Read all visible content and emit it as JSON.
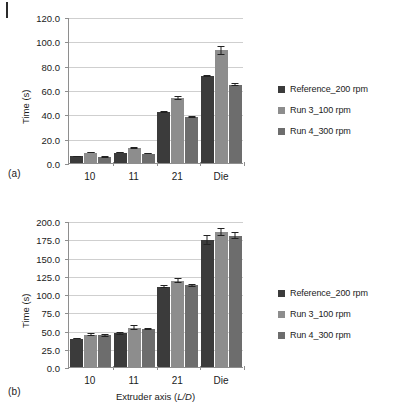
{
  "figure": {
    "panel_a_tag": "(a)",
    "panel_b_tag": "(b)",
    "legend_labels": [
      "Reference_200 rpm",
      "Run 3_100 rpm",
      "Run 4_300 rpm"
    ],
    "series_colors": [
      "#3b3b3b",
      "#8d8d8d",
      "#6d6d6d"
    ],
    "grid_color": "#cfcfcf",
    "axis_color": "#8e8e8e"
  },
  "chart_data": [
    {
      "type": "bar",
      "panel": "(a)",
      "title": "",
      "xlabel": "",
      "ylabel": "Time (s)",
      "categories": [
        "10",
        "11",
        "21",
        "Die"
      ],
      "ylim": [
        0,
        120
      ],
      "ytick_step": 20,
      "ytick_labels": [
        "0.0",
        "20.0",
        "40.0",
        "60.0",
        "80.0",
        "100.0",
        "120.0"
      ],
      "ytick_values": [
        0,
        20,
        40,
        60,
        80,
        100,
        120
      ],
      "grid": true,
      "legend_position": "right",
      "series": [
        {
          "name": "Reference_200 rpm",
          "color": "#3b3b3b",
          "values": [
            5.5,
            8.5,
            42.0,
            71.5
          ],
          "errors": [
            0.6,
            0.6,
            0.8,
            1.0
          ]
        },
        {
          "name": "Run 3_100 rpm",
          "color": "#8d8d8d",
          "values": [
            8.5,
            12.5,
            53.5,
            92.5
          ],
          "errors": [
            0.6,
            0.7,
            2.0,
            3.5
          ]
        },
        {
          "name": "Run 4_300 rpm",
          "color": "#6d6d6d",
          "values": [
            5.0,
            7.8,
            38.0,
            64.5
          ],
          "errors": [
            0.5,
            0.5,
            1.0,
            1.2
          ]
        }
      ]
    },
    {
      "type": "bar",
      "panel": "(b)",
      "title": "",
      "xlabel": "Extruder axis (L/D)",
      "xlabel_prefix": "Extruder axis (",
      "xlabel_italic": "L/D",
      "xlabel_suffix": ")",
      "ylabel": "Time (s)",
      "categories": [
        "10",
        "11",
        "21",
        "Die"
      ],
      "ylim": [
        0,
        200
      ],
      "ytick_step": 25,
      "ytick_labels": [
        "0.0",
        "25.0",
        "50.0",
        "75.0",
        "100.0",
        "125.0",
        "150.0",
        "175.0",
        "200.0"
      ],
      "ytick_values": [
        0,
        25,
        50,
        75,
        100,
        125,
        150,
        175,
        200
      ],
      "grid": true,
      "legend_position": "right",
      "series": [
        {
          "name": "Reference_200 rpm",
          "color": "#3b3b3b",
          "values": [
            39.0,
            46.5,
            110.0,
            174.0
          ],
          "errors": [
            1.2,
            2.0,
            2.0,
            7.0
          ]
        },
        {
          "name": "Run 3_100 rpm",
          "color": "#8d8d8d",
          "values": [
            44.5,
            54.0,
            118.5,
            185.0
          ],
          "errors": [
            2.0,
            3.0,
            4.0,
            6.0
          ]
        },
        {
          "name": "Run 4_300 rpm",
          "color": "#6d6d6d",
          "values": [
            43.5,
            52.5,
            112.0,
            180.0
          ],
          "errors": [
            2.0,
            1.5,
            2.0,
            5.0
          ]
        }
      ]
    }
  ]
}
